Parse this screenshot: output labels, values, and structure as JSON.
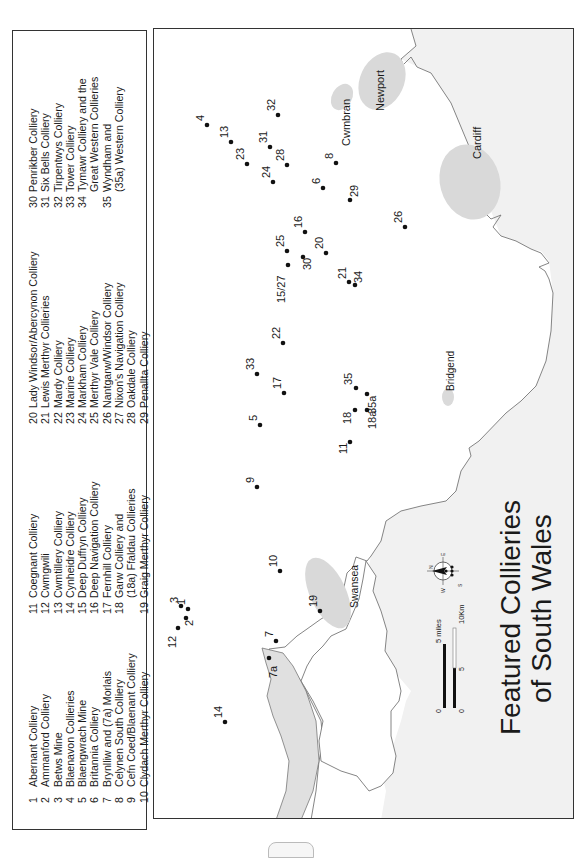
{
  "title": {
    "line1": "Featured Collieries",
    "line2": "of South Wales"
  },
  "legend": {
    "columns": [
      [
        {
          "num": "1",
          "name": "Abernant Colliery"
        },
        {
          "num": "2",
          "name": "Ammanford Colliery"
        },
        {
          "num": "3",
          "name": "Betws Mine"
        },
        {
          "num": "4",
          "name": "Blaenavon Collieries"
        },
        {
          "num": "5",
          "name": "Blaengwrach Mine"
        },
        {
          "num": "6",
          "name": "Britannia Colliery"
        },
        {
          "num": "7",
          "name": "Brynlliw and (7a) Morlais"
        },
        {
          "num": "8",
          "name": "Celynen South Colliery"
        },
        {
          "num": "9",
          "name": "Cefn Coed/Blaenant Colliery"
        },
        {
          "num": "10",
          "name": "Clydach Merthyr Colliery"
        }
      ],
      [
        {
          "num": "11",
          "name": "Coegnant Colliery"
        },
        {
          "num": "12",
          "name": "Cwmgwili"
        },
        {
          "num": "13",
          "name": "Cwmtillery Colliery"
        },
        {
          "num": "14",
          "name": "Cynheidre Colliery"
        },
        {
          "num": "15",
          "name": "Deep Duffryn Colliery"
        },
        {
          "num": "16",
          "name": "Deep Navigation Colliery"
        },
        {
          "num": "17",
          "name": "Fernhill Colliery"
        },
        {
          "num": "18",
          "name": "Garw Colliery and",
          "cont": "(18a) Ffaldau Collieries"
        },
        {
          "num": "19",
          "name": "Graig Merthyr Colliery"
        }
      ],
      [
        {
          "num": "20",
          "name": "Lady Windsor/Abercynon Colliery"
        },
        {
          "num": "21",
          "name": "Lewis Merthyr Collieries"
        },
        {
          "num": "22",
          "name": "Mardy Colliery"
        },
        {
          "num": "23",
          "name": "Marine Colliery"
        },
        {
          "num": "24",
          "name": "Markham Colliery"
        },
        {
          "num": "25",
          "name": "Merthyr Vale Colliery"
        },
        {
          "num": "26",
          "name": "Nantgarw/Windsor Colliery"
        },
        {
          "num": "27",
          "name": "Nixon's Navigation Colliery"
        },
        {
          "num": "28",
          "name": "Oakdale Colliery"
        },
        {
          "num": "29",
          "name": "Penallta Colliery"
        }
      ],
      [
        {
          "num": "30",
          "name": "Penrikber Colliery"
        },
        {
          "num": "31",
          "name": "Six Bells Colliery"
        },
        {
          "num": "32",
          "name": "Tirpentwys Colliery"
        },
        {
          "num": "33",
          "name": "Tower Colliery"
        },
        {
          "num": "34",
          "name": "Tymawr Colliery and the",
          "cont": "Great Western Collieries"
        },
        {
          "num": "35",
          "name": "Wyndham and",
          "cont": "(35a) Western Colliery"
        }
      ]
    ]
  },
  "towns": {
    "newport": "Newport",
    "cwmbran": "Cwmbran",
    "cardiff": "Cardiff",
    "bridgend": "Bridgend",
    "swansea": "Swansea"
  },
  "markers": [
    {
      "label": "4",
      "x": 206,
      "y": 124
    },
    {
      "label": "13",
      "x": 230,
      "y": 141
    },
    {
      "label": "32",
      "x": 277,
      "y": 114
    },
    {
      "label": "31",
      "x": 269,
      "y": 146
    },
    {
      "label": "23",
      "x": 246,
      "y": 163
    },
    {
      "label": "28",
      "x": 286,
      "y": 164
    },
    {
      "label": "24",
      "x": 272,
      "y": 181
    },
    {
      "label": "8",
      "x": 335,
      "y": 162
    },
    {
      "label": "6",
      "x": 322,
      "y": 187
    },
    {
      "label": "29",
      "x": 349,
      "y": 199
    },
    {
      "label": "26",
      "x": 404,
      "y": 226
    },
    {
      "label": "16",
      "x": 304,
      "y": 231
    },
    {
      "label": "25",
      "x": 286,
      "y": 250
    },
    {
      "label": "20",
      "x": 325,
      "y": 252
    },
    {
      "label": "30",
      "x": 302,
      "y": 256
    },
    {
      "label": "15/27",
      "x": 287,
      "y": 264
    },
    {
      "label": "21",
      "x": 348,
      "y": 281
    },
    {
      "label": "34",
      "x": 354,
      "y": 284
    },
    {
      "label": "22",
      "x": 282,
      "y": 342
    },
    {
      "label": "33",
      "x": 256,
      "y": 373
    },
    {
      "label": "17",
      "x": 283,
      "y": 392
    },
    {
      "label": "5",
      "x": 259,
      "y": 424
    },
    {
      "label": "35",
      "x": 355,
      "y": 387
    },
    {
      "label": "35a",
      "x": 366,
      "y": 393
    },
    {
      "label": "18",
      "x": 354,
      "y": 409
    },
    {
      "label": "18a",
      "x": 366,
      "y": 409
    },
    {
      "label": "11",
      "x": 349,
      "y": 441
    },
    {
      "label": "9",
      "x": 256,
      "y": 486
    },
    {
      "label": "10",
      "x": 279,
      "y": 570
    },
    {
      "label": "3",
      "x": 180,
      "y": 605
    },
    {
      "label": "1",
      "x": 187,
      "y": 608
    },
    {
      "label": "2",
      "x": 185,
      "y": 617
    },
    {
      "label": "12",
      "x": 177,
      "y": 627
    },
    {
      "label": "19",
      "x": 319,
      "y": 610
    },
    {
      "label": "7",
      "x": 275,
      "y": 640
    },
    {
      "label": "7a",
      "x": 268,
      "y": 657
    },
    {
      "label": "14",
      "x": 224,
      "y": 721
    }
  ],
  "compass": {
    "n": "N",
    "e": "E",
    "s": "S",
    "w": "W"
  },
  "scale": {
    "miles_label": "5 miles",
    "miles_zero": "0",
    "km_label": "10Km",
    "km_mid": "5",
    "km_zero": "0"
  },
  "colors": {
    "urban_fill": "#d9d9d9",
    "sea_fill": "#ececec",
    "coastline": "#777777",
    "frame": "#333333",
    "marker": "#111111"
  }
}
